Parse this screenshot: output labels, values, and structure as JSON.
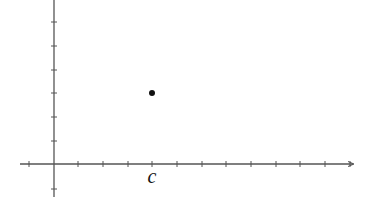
{
  "figure": {
    "x_axis": {
      "y_pixel": 164,
      "x_start": 20,
      "x_end": 353,
      "tick_positions": [
        29,
        78,
        103,
        128,
        152,
        177,
        202,
        226,
        251,
        276,
        300,
        325,
        350
      ],
      "arrow": "right"
    },
    "y_axis": {
      "x_pixel": 54,
      "y_start": 0,
      "y_end": 197,
      "tick_positions": [
        22,
        46,
        70,
        93,
        117,
        141,
        189
      ]
    },
    "points": [
      {
        "label": "",
        "cx": 152,
        "cy": 93,
        "r": 3
      }
    ],
    "labels": [
      {
        "text": "c",
        "x": 152,
        "y": 183
      }
    ],
    "colors": {
      "axis": "#555555",
      "point": "#111111",
      "background": "#ffffff"
    }
  }
}
